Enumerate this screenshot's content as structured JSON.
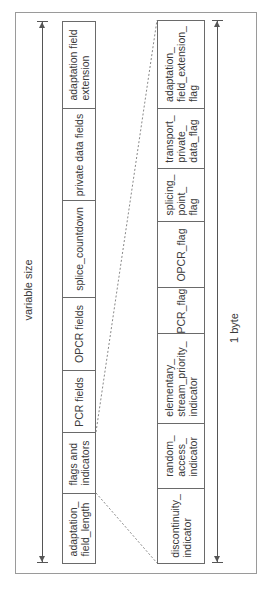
{
  "diagram": {
    "upper_dimension_label": "variable size",
    "lower_dimension_label": "1 byte",
    "upper_fields": [
      {
        "label": "adaptation field\nextension",
        "top": 21,
        "bottom": 108
      },
      {
        "label": "private data fields",
        "top": 108,
        "bottom": 200
      },
      {
        "label": "splice_countdown",
        "top": 200,
        "bottom": 297
      },
      {
        "label": "OPCR fields",
        "top": 297,
        "bottom": 370
      },
      {
        "label": "PCR fields",
        "top": 370,
        "bottom": 432
      },
      {
        "label": "flags and\nindicators",
        "top": 432,
        "bottom": 493
      },
      {
        "label": "adaptation_\nfield_length",
        "top": 493,
        "bottom": 563
      }
    ],
    "lower_fields": [
      {
        "label": "adaptation_\nfield_extension_\nflag",
        "top": 20,
        "bottom": 108
      },
      {
        "label": "transport_\nprivate_\ndata_flag",
        "top": 108,
        "bottom": 168
      },
      {
        "label": "splicing_\npoint_\nflag",
        "top": 168,
        "bottom": 221
      },
      {
        "label": "OPCR_flag",
        "top": 221,
        "bottom": 287
      },
      {
        "label": "PCR_flag",
        "top": 287,
        "bottom": 333
      },
      {
        "label": "elementary_\nstream_priority_\nindicator",
        "top": 333,
        "bottom": 423
      },
      {
        "label": "random_\naccess_\nindicator",
        "top": 423,
        "bottom": 488
      },
      {
        "label": "discontinuity_\nindicator",
        "top": 488,
        "bottom": 563
      }
    ],
    "colors": {
      "line": "#6a6a6a",
      "text": "#3a3a3a",
      "frame": "#9a9a9a",
      "dashed": "#888888"
    }
  }
}
